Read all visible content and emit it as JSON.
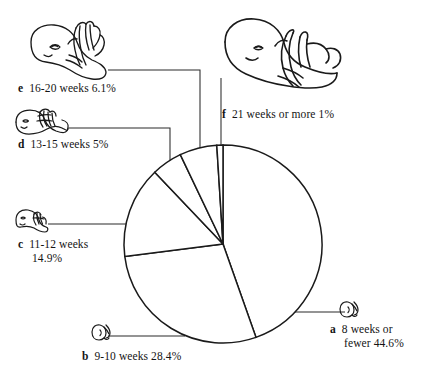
{
  "chart_data": {
    "type": "pie",
    "title": "",
    "subtitle": "",
    "xlabel": "",
    "ylabel": "",
    "legend_position": "callout-labels",
    "grid": false,
    "units": "percent",
    "start_angle_deg": 0,
    "direction": "clockwise",
    "center": {
      "x": 223,
      "y": 244
    },
    "radius": 99,
    "categories": [
      "8 weeks or fewer",
      "9-10 weeks",
      "11-12 weeks",
      "13-15 weeks",
      "16-20 weeks",
      "21 weeks or more"
    ],
    "values": [
      44.6,
      28.4,
      14.9,
      5,
      6.1,
      1
    ],
    "markers": [
      "a",
      "b",
      "c",
      "d",
      "e",
      "f"
    ],
    "slices": [
      {
        "marker": "a",
        "label": "8 weeks or fewer",
        "value": 44.6,
        "value_text": "44.6%",
        "start_deg": 0,
        "end_deg": 160.56
      },
      {
        "marker": "b",
        "label": "9-10 weeks",
        "value": 28.4,
        "value_text": "28.4%",
        "start_deg": 160.56,
        "end_deg": 262.8
      },
      {
        "marker": "c",
        "label": "11-12 weeks",
        "value": 14.9,
        "value_text": "14.9%",
        "start_deg": 262.8,
        "end_deg": 316.44
      },
      {
        "marker": "d",
        "label": "13-15 weeks",
        "value": 5,
        "value_text": "5%",
        "start_deg": 316.44,
        "end_deg": 334.44
      },
      {
        "marker": "e",
        "label": "16-20 weeks",
        "value": 6.1,
        "value_text": "6.1%",
        "start_deg": 334.44,
        "end_deg": 356.4
      },
      {
        "marker": "f",
        "label": "21 weeks or more",
        "value": 1,
        "value_text": "1%",
        "start_deg": 356.4,
        "end_deg": 360
      }
    ],
    "colors": {
      "slice_fill": "#ffffff",
      "slice_stroke": "#1a1a1a",
      "leader_line": "#2b2b2b",
      "text": "#141414",
      "background": "#ffffff"
    }
  },
  "labels": {
    "a": {
      "marker": "a",
      "line1": "8 weeks or",
      "line2": "fewer 44.6%"
    },
    "b": {
      "marker": "b",
      "line1": "9-10 weeks 28.4%",
      "line2": ""
    },
    "c": {
      "marker": "c",
      "line1": "11-12 weeks",
      "line2": "14.9%"
    },
    "d": {
      "marker": "d",
      "line1": "13-15 weeks 5%",
      "line2": ""
    },
    "e": {
      "marker": "e",
      "line1": "16-20 weeks 6.1%",
      "line2": ""
    },
    "f": {
      "marker": "f",
      "line1": "21 weeks or more 1%",
      "line2": ""
    }
  },
  "illustrations": {
    "a": "embryo-icon-a",
    "b": "embryo-icon-b",
    "c": "embryo-icon-c",
    "d": "fetus-icon-d",
    "e": "fetus-icon-e",
    "f": "fetus-icon-f"
  }
}
